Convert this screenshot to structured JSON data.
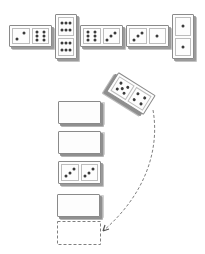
{
  "diagram": {
    "top_row": [
      {
        "id": "d1",
        "orientation": "horizontal",
        "values": [
          2,
          6
        ],
        "x": 9,
        "y": 25,
        "w": 43,
        "h": 22
      },
      {
        "id": "d2",
        "orientation": "vertical",
        "values": [
          6,
          6
        ],
        "x": 55,
        "y": 14,
        "w": 22,
        "h": 45
      },
      {
        "id": "d3",
        "orientation": "horizontal",
        "values": [
          6,
          3
        ],
        "x": 80,
        "y": 25,
        "w": 43,
        "h": 22
      },
      {
        "id": "d4",
        "orientation": "horizontal",
        "values": [
          3,
          1
        ],
        "x": 126,
        "y": 25,
        "w": 43,
        "h": 22
      },
      {
        "id": "d5",
        "orientation": "vertical",
        "values": [
          1,
          1
        ],
        "x": 172,
        "y": 14,
        "w": 22,
        "h": 45
      }
    ],
    "tilted_domino": {
      "values": [
        5,
        4
      ],
      "cx": 131,
      "cy": 93,
      "w": 44,
      "h": 23,
      "rotation_deg": 32
    },
    "stack": [
      {
        "id": "s1",
        "face": "blank",
        "x": 58,
        "y": 101,
        "w": 43,
        "h": 23
      },
      {
        "id": "s2",
        "face": "blank",
        "x": 58,
        "y": 131,
        "w": 43,
        "h": 23
      },
      {
        "id": "s3",
        "face": "pips",
        "values": [
          3,
          3
        ],
        "x": 58,
        "y": 161,
        "w": 43,
        "h": 23
      },
      {
        "id": "s4",
        "face": "blank",
        "x": 57,
        "y": 194,
        "w": 43,
        "h": 23
      }
    ],
    "empty_slot": {
      "style": "dashed",
      "x": 57,
      "y": 221,
      "w": 43,
      "h": 23
    },
    "arrow": {
      "style": "dashed",
      "from": [
        153,
        110
      ],
      "to": [
        103,
        231
      ],
      "head": "arrow"
    },
    "colors": {
      "outline": "#8a8a8a",
      "shadow": "#9a9a9a",
      "pip": "#3a3a3a",
      "dash": "#808080",
      "background": "#ffffff"
    }
  }
}
